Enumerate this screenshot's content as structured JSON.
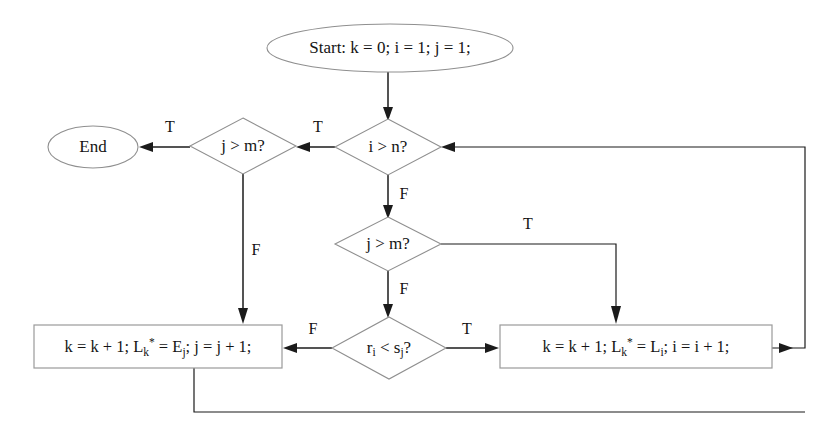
{
  "diagram": {
    "type": "flowchart",
    "canvas": {
      "width": 838,
      "height": 439
    },
    "colors": {
      "background": "#ffffff",
      "node_stroke": "#8f8f8f",
      "edge_stroke": "#1b1b1b",
      "text": "#141414"
    },
    "nodes": [
      {
        "id": "start",
        "shape": "ellipse",
        "label": "Start: k = 0; i = 1; j = 1;",
        "cx": 390,
        "cy": 48,
        "rx": 123,
        "ry": 24
      },
      {
        "id": "end",
        "shape": "ellipse",
        "label": "End",
        "cx": 93,
        "cy": 147,
        "rx": 45,
        "ry": 21
      },
      {
        "id": "i_gt_n",
        "shape": "diamond",
        "label": "i > n?",
        "cx": 388,
        "cy": 147,
        "rx": 53,
        "ry": 28
      },
      {
        "id": "j_gt_m_left",
        "shape": "diamond",
        "label": "j > m?",
        "cx": 243,
        "cy": 146,
        "rx": 53,
        "ry": 28
      },
      {
        "id": "j_gt_m_mid",
        "shape": "diamond",
        "label": "j > m?",
        "cx": 388,
        "cy": 244,
        "rx": 53,
        "ry": 27
      },
      {
        "id": "r_lt_s",
        "shape": "diamond",
        "label": "r_i < s_j?",
        "label_parts": [
          "r",
          "i",
          " < s",
          "j",
          "?"
        ],
        "cx": 389,
        "cy": 348,
        "rx": 57,
        "ry": 31
      },
      {
        "id": "proc_left",
        "shape": "rect",
        "label": "k = k + 1;  L_k* = E_j;  j = j + 1;",
        "x": 34,
        "y": 325,
        "width": 248,
        "height": 43
      },
      {
        "id": "proc_right",
        "shape": "rect",
        "label": "k = k + 1;   L_k* = L_i;   i = i + 1;",
        "x": 500,
        "y": 325,
        "width": 272,
        "height": 43
      }
    ],
    "edges": [
      {
        "id": "start-to-i_gt_n",
        "from": "start",
        "to": "i_gt_n",
        "label": ""
      },
      {
        "id": "i_gt_n-true-to-j_gt_m_left",
        "from": "i_gt_n",
        "to": "j_gt_m_left",
        "label": "T"
      },
      {
        "id": "j_gt_m_left-true-to-end",
        "from": "j_gt_m_left",
        "to": "end",
        "label": "T"
      },
      {
        "id": "i_gt_n-false-to-j_gt_m_mid",
        "from": "i_gt_n",
        "to": "j_gt_m_mid",
        "label": "F"
      },
      {
        "id": "j_gt_m_left-false-to-proc_left",
        "from": "j_gt_m_left",
        "to": "proc_left",
        "label": "F"
      },
      {
        "id": "j_gt_m_mid-true-to-proc_right",
        "from": "j_gt_m_mid",
        "to": "proc_right",
        "label": "T"
      },
      {
        "id": "j_gt_m_mid-false-to-r_lt_s",
        "from": "j_gt_m_mid",
        "to": "r_lt_s",
        "label": "F"
      },
      {
        "id": "r_lt_s-false-to-proc_left",
        "from": "r_lt_s",
        "to": "proc_left",
        "label": "F"
      },
      {
        "id": "r_lt_s-true-to-proc_right",
        "from": "r_lt_s",
        "to": "proc_right",
        "label": "T"
      },
      {
        "id": "proc_right-loop-to-i_gt_n",
        "from": "proc_right",
        "to": "i_gt_n",
        "label": ""
      },
      {
        "id": "proc_left-loop-to-i_gt_n",
        "from": "proc_left",
        "to": "i_gt_n",
        "label": ""
      }
    ],
    "edge_labels": {
      "i_gt_n_true": "T",
      "j_gt_m_left_true": "T",
      "i_gt_n_false": "F",
      "j_gt_m_left_false": "F",
      "j_gt_m_mid_true": "T",
      "j_gt_m_mid_false": "F",
      "r_lt_s_false": "F",
      "r_lt_s_true": "T"
    },
    "text": {
      "start_label": "Start: k = 0; i = 1; j = 1;",
      "end_label": "End",
      "i_gt_n_label": "i > n?",
      "j_gt_m_left_label": "j > m?",
      "j_gt_m_mid_label": "j > m?",
      "r_label_base": "r",
      "r_label_sub": "i",
      "r_label_mid": " < s",
      "r_label_sub2": "j",
      "r_label_end": "?",
      "proc_left_p1": "k = k + 1;  L",
      "proc_left_sub1": "k",
      "proc_left_sup1": "*",
      "proc_left_p2": " = E",
      "proc_left_sub2": "j",
      "proc_left_p3": ";  j = j + 1;",
      "proc_right_p1": "k = k + 1;   L",
      "proc_right_sub1": "k",
      "proc_right_sup1": "*",
      "proc_right_p2": " = L",
      "proc_right_sub2": "i",
      "proc_right_p3": ";   i = i + 1;"
    }
  }
}
